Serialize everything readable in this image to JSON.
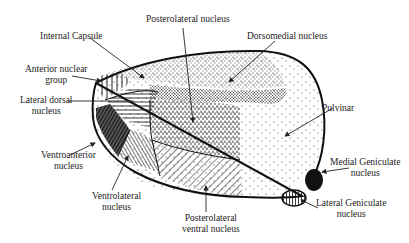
{
  "diagram": {
    "labels": [
      {
        "id": "internal-capsule",
        "lines": [
          "Internal Capsule"
        ]
      },
      {
        "id": "anterior-nuclear-group",
        "lines": [
          "Anterior nuclear",
          "group"
        ]
      },
      {
        "id": "lateral-dorsal-nucleus",
        "lines": [
          "Lateral dorsal",
          "nucleus"
        ]
      },
      {
        "id": "ventroanterior-nucleus",
        "lines": [
          "Ventroanterior",
          "nucleus"
        ]
      },
      {
        "id": "ventrolateral-nucleus",
        "lines": [
          "Ventrolateral",
          "nucleus"
        ]
      },
      {
        "id": "posterolateral-nucleus",
        "lines": [
          "Posterolateral nucleus"
        ]
      },
      {
        "id": "dorsomedial-nucleus",
        "lines": [
          "Dorsomedial nucleus"
        ]
      },
      {
        "id": "pulvinar",
        "lines": [
          "Pulvinar"
        ]
      },
      {
        "id": "medial-geniculate-nucleus",
        "lines": [
          "Medial Geniculate",
          "nucleus"
        ]
      },
      {
        "id": "lateral-geniculate-nucleus",
        "lines": [
          "Lateral Geniculate",
          "nucleus"
        ]
      },
      {
        "id": "posterolateral-ventral-nucleus",
        "lines": [
          "Posterolateral",
          "ventral nucleus"
        ]
      }
    ]
  }
}
